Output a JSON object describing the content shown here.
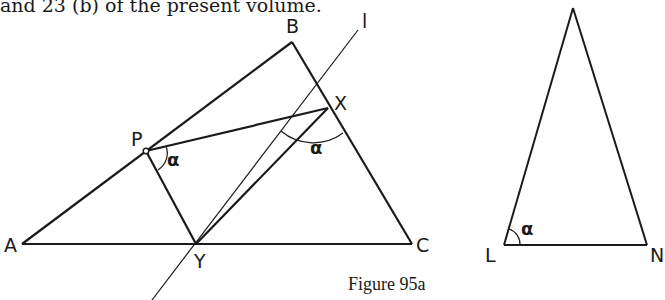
{
  "header_text": "and 23 (b) of the present volume.",
  "figure": {
    "caption": "Figure 95a",
    "left_diagram": {
      "points": {
        "A": {
          "label": "A",
          "x": 22,
          "y": 244
        },
        "B": {
          "label": "B",
          "x": 292,
          "y": 42
        },
        "C": {
          "label": "C",
          "x": 412,
          "y": 244
        },
        "P": {
          "label": "P",
          "x": 146,
          "y": 151
        },
        "X": {
          "label": "X",
          "x": 328,
          "y": 78
        },
        "Y": {
          "label": "Y",
          "x": 196,
          "y": 244
        }
      },
      "line_label": "l",
      "angle_labels": [
        "α",
        "α"
      ]
    },
    "right_diagram": {
      "points": {
        "L": {
          "label": "L",
          "x": 504,
          "y": 245
        },
        "N": {
          "label": "N",
          "x": 647,
          "y": 245
        },
        "T": {
          "label": "",
          "x": 573,
          "y": 8
        }
      },
      "angle_label": "α"
    },
    "colors": {
      "stroke": "#1a1a1a",
      "background": "#ffffff"
    }
  }
}
